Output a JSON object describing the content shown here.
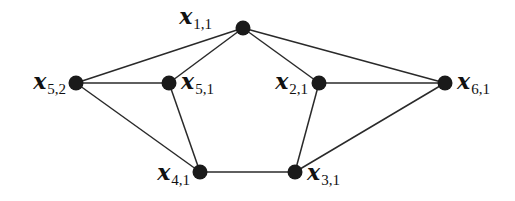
{
  "graph": {
    "nodes": [
      {
        "id": "x11",
        "var": "x",
        "sub": "1,1"
      },
      {
        "id": "x52",
        "var": "x",
        "sub": "5,2"
      },
      {
        "id": "x51",
        "var": "x",
        "sub": "5,1"
      },
      {
        "id": "x21",
        "var": "x",
        "sub": "2,1"
      },
      {
        "id": "x61",
        "var": "x",
        "sub": "6,1"
      },
      {
        "id": "x41",
        "var": "x",
        "sub": "4,1"
      },
      {
        "id": "x31",
        "var": "x",
        "sub": "3,1"
      }
    ],
    "edges": [
      [
        "x11",
        "x52"
      ],
      [
        "x11",
        "x51"
      ],
      [
        "x11",
        "x21"
      ],
      [
        "x11",
        "x61"
      ],
      [
        "x52",
        "x51"
      ],
      [
        "x52",
        "x41"
      ],
      [
        "x51",
        "x41"
      ],
      [
        "x21",
        "x61"
      ],
      [
        "x21",
        "x31"
      ],
      [
        "x61",
        "x31"
      ],
      [
        "x41",
        "x31"
      ]
    ]
  }
}
